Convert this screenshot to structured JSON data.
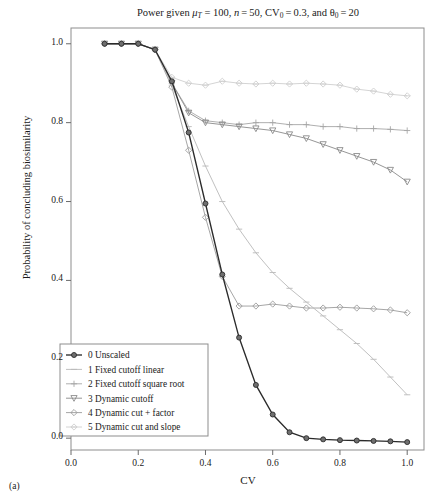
{
  "figure": {
    "sublabel": "(a)",
    "title_plain": "Power given μT = 100, n = 50, CV0 = 0.3, and θ0 = 20"
  },
  "chart_data": {
    "type": "line",
    "xlabel": "CV",
    "ylabel": "Probability of concluding biosimilarity",
    "xlim": [
      0.0,
      1.05
    ],
    "ylim": [
      -0.03,
      1.04
    ],
    "xticks": [
      "0.0",
      "0.2",
      "0.4",
      "0.6",
      "0.8",
      "1.0"
    ],
    "xtick_values": [
      0.0,
      0.2,
      0.4,
      0.6,
      0.8,
      1.0
    ],
    "yticks": [
      "0.0",
      "0.2",
      "0.4",
      "0.6",
      "0.8",
      "1.0"
    ],
    "ytick_values": [
      0.0,
      0.2,
      0.4,
      0.6,
      0.8,
      1.0
    ],
    "grid": false,
    "legend_position": "lower-left-inside",
    "x": [
      0.1,
      0.15,
      0.2,
      0.25,
      0.3,
      0.35,
      0.4,
      0.45,
      0.5,
      0.55,
      0.6,
      0.65,
      0.7,
      0.75,
      0.8,
      0.85,
      0.9,
      0.95,
      1.0
    ],
    "series": [
      {
        "name": "0 Unscaled",
        "label": "0 Unscaled",
        "marker": "circle-filled",
        "color": "#2b2b2b",
        "values": [
          1.0,
          1.0,
          1.0,
          0.985,
          0.905,
          0.775,
          0.595,
          0.415,
          0.255,
          0.135,
          0.06,
          0.015,
          0.0,
          -0.003,
          -0.005,
          -0.006,
          -0.007,
          -0.008,
          -0.01
        ]
      },
      {
        "name": "1 Fixed cutoff linear",
        "label": "1 Fixed cutoff linear",
        "marker": "dash",
        "color": "#b9b9b9",
        "values": [
          1.0,
          1.0,
          1.0,
          0.985,
          0.895,
          0.79,
          0.69,
          0.6,
          0.53,
          0.47,
          0.42,
          0.38,
          0.345,
          0.31,
          0.275,
          0.24,
          0.2,
          0.155,
          0.11
        ]
      },
      {
        "name": "2 Fixed cutoff square root",
        "label": "2 Fixed cutoff square root",
        "marker": "plus",
        "color": "#a6a6a6",
        "values": [
          1.0,
          1.0,
          1.0,
          0.985,
          0.9,
          0.83,
          0.805,
          0.8,
          0.795,
          0.8,
          0.8,
          0.795,
          0.795,
          0.79,
          0.79,
          0.785,
          0.785,
          0.783,
          0.78
        ]
      },
      {
        "name": "3 Dynamic cutoff",
        "label": "3 Dynamic cutoff",
        "marker": "triangle",
        "color": "#8a8a8a",
        "values": [
          1.0,
          1.0,
          1.0,
          0.985,
          0.9,
          0.825,
          0.8,
          0.795,
          0.79,
          0.785,
          0.78,
          0.77,
          0.76,
          0.745,
          0.73,
          0.715,
          0.7,
          0.68,
          0.65
        ]
      },
      {
        "name": "4 Dynamic cut + factor",
        "label": "4 Dynamic cut + factor",
        "marker": "diamond",
        "color": "#9c9c9c",
        "values": [
          1.0,
          1.0,
          1.0,
          0.985,
          0.89,
          0.73,
          0.56,
          0.41,
          0.335,
          0.335,
          0.34,
          0.335,
          0.33,
          0.33,
          0.332,
          0.33,
          0.328,
          0.325,
          0.318
        ]
      },
      {
        "name": "5 Dynamic cut and slope",
        "label": "5 Dynamic cut and slope",
        "marker": "star",
        "color": "#cfcfcf",
        "values": [
          1.0,
          1.0,
          1.0,
          0.985,
          0.915,
          0.9,
          0.895,
          0.905,
          0.9,
          0.898,
          0.9,
          0.898,
          0.9,
          0.898,
          0.895,
          0.885,
          0.88,
          0.872,
          0.868
        ]
      }
    ]
  }
}
